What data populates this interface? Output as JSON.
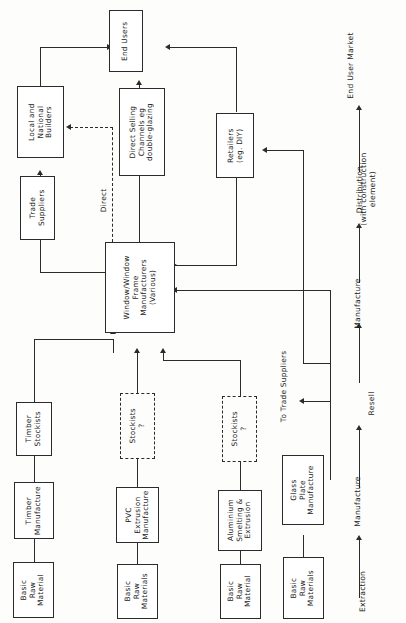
{
  "diagram": {
    "nodes": {
      "end_users": "End Users",
      "local_national_builders": "Local and\nNational\nBuilders",
      "trade_suppliers": "Trade\nSuppliers",
      "direct_selling": "Direct Selling\nChannels eg\ndouble-glazing",
      "retailers": "Retailers\n(eg. DIY)",
      "window_manufacturers": "Window/Window\nFrame\nManufacturers\n(Various)",
      "timber_stockists": "Timber\nStockists",
      "timber_manufacture": "Timber\nManufacture",
      "pvc_stockists": "Stockists\n?",
      "pvc_extrusion": "PVC\nExtrusion\nManufacture",
      "alu_stockists": "Stockists\n?",
      "alu_smelting": "Aluminium\nSmelting &\nExtrusion",
      "glass_plate": "Glass\nPlate\nManufacture",
      "raw_timber": "Basic\nRaw\nMaterial",
      "raw_pvc": "Basic\nRaw\nMaterials",
      "raw_alu": "Basic\nRaw\nMaterial",
      "raw_glass": "Basic\nRaw\nMaterials"
    },
    "edge_labels": {
      "direct": "Direct",
      "to_trade_suppliers": "To Trade Suppliers"
    },
    "axis": {
      "stages": [
        "Extraction",
        "Manufacture",
        "Resell",
        "Manufacture",
        "Distribution",
        "End User Market"
      ],
      "distribution_note": "(with construction\nelement)"
    }
  }
}
